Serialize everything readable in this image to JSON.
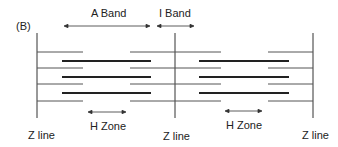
{
  "figure": {
    "panel_label": "(B)"
  },
  "labels": {
    "a_band": "A Band",
    "i_band": "I Band",
    "h_zone_left": "H Zone",
    "h_zone_right": "H Zone",
    "z_line_left": "Z line",
    "z_line_middle": "Z line",
    "z_line_right": "Z line"
  },
  "colors": {
    "line": "#333333",
    "thin_filament": "#444444",
    "thick_filament": "#222222",
    "text": "#222222"
  }
}
